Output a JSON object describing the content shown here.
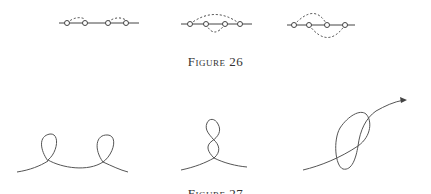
{
  "figures": [
    {
      "caption": "Figure 26",
      "diagrams": [
        {
          "name": "two-arcs-above",
          "points": 4
        },
        {
          "name": "nested-arcs-above-below",
          "points": 4
        },
        {
          "name": "crossing-arcs",
          "points": 4
        }
      ]
    },
    {
      "caption": "Figure 27",
      "diagrams": [
        {
          "name": "double-loop-curve"
        },
        {
          "name": "figure-eight-curve"
        },
        {
          "name": "self-crossing-arrow-curve"
        }
      ]
    }
  ],
  "colors": {
    "stroke": "#444444",
    "text": "#333333"
  }
}
